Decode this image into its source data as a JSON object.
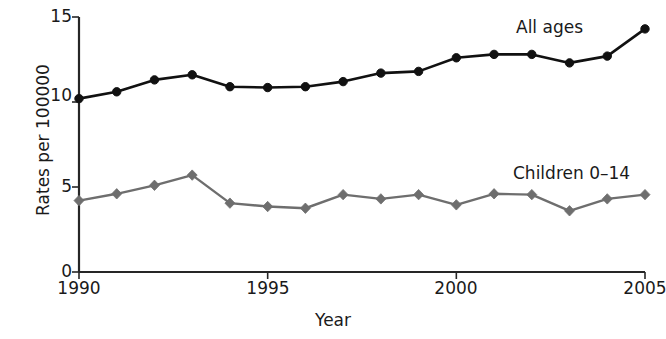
{
  "chart_data": {
    "type": "line",
    "title": "",
    "xlabel": "Year",
    "ylabel": "Rates per 100000",
    "xlim": [
      1990,
      2005
    ],
    "ylim": [
      0,
      15
    ],
    "grid": false,
    "legend_position": "inline-annotation",
    "x": [
      1990,
      1991,
      1992,
      1993,
      1994,
      1995,
      1996,
      1997,
      1998,
      1999,
      2000,
      2001,
      2002,
      2003,
      2004,
      2005
    ],
    "xticks": [
      "1990",
      "1995",
      "2000",
      "2005"
    ],
    "xtick_values": [
      1990,
      1995,
      2000,
      2005
    ],
    "yticks": [
      "0",
      "5",
      "10",
      "15"
    ],
    "ytick_values": [
      0,
      5,
      10,
      15
    ],
    "series": [
      {
        "name": "All ages",
        "color": "#111111",
        "marker": "circle",
        "values": [
          10.2,
          10.6,
          11.3,
          11.6,
          10.9,
          10.85,
          10.9,
          11.2,
          11.7,
          11.8,
          12.6,
          12.8,
          12.8,
          12.3,
          12.7,
          14.3
        ]
      },
      {
        "name": "Children 0–14",
        "color": "#6e6e6e",
        "marker": "diamond",
        "values": [
          4.2,
          4.6,
          5.1,
          5.7,
          4.05,
          3.85,
          3.75,
          4.55,
          4.3,
          4.55,
          3.95,
          4.6,
          4.55,
          3.6,
          4.3,
          4.55
        ]
      }
    ],
    "annotations": [
      {
        "text": "All ages",
        "x": 2003.2,
        "y": 13.9
      },
      {
        "text": "Children 0–14",
        "x": 2002.9,
        "y": 6.4
      }
    ]
  },
  "axes": {
    "y_title": "Rates per 100000",
    "x_title": "Year",
    "y_tick_labels": [
      "15",
      "10",
      "5",
      "0"
    ],
    "x_tick_labels": [
      "1990",
      "1995",
      "2000",
      "2005"
    ]
  },
  "labels": {
    "all_ages": "All ages",
    "children": "Children 0–14"
  },
  "colors": {
    "all_ages": "#111111",
    "children": "#6e6e6e",
    "axis": "#262626",
    "background": "#ffffff"
  }
}
